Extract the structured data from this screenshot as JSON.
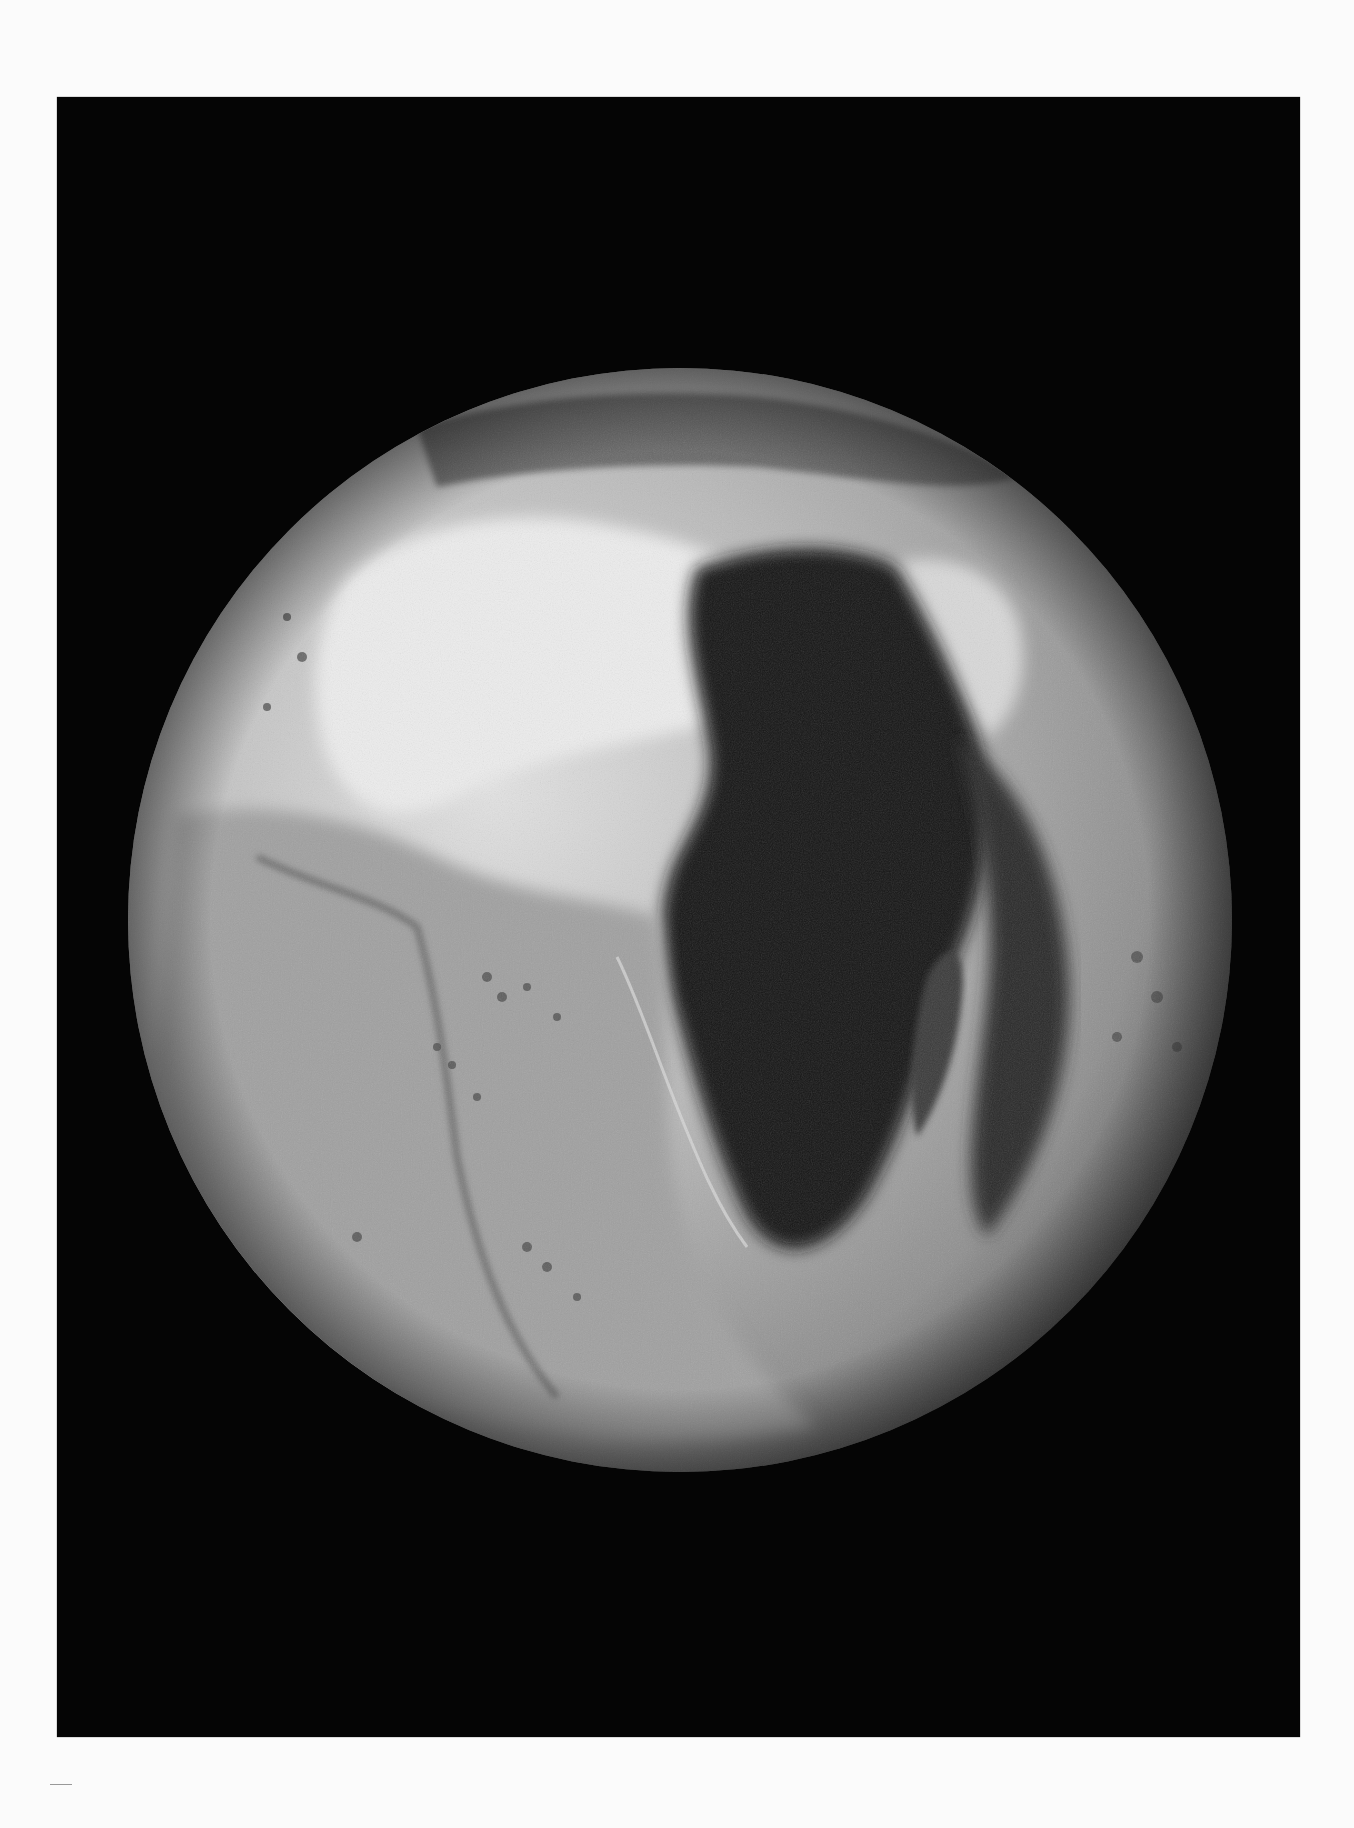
{
  "image": {
    "subject": "relief-globe",
    "description": "Black-and-white photograph of a raised-relief globe showing Africa, the Atlantic Ocean seafloor, the Mid-Atlantic Ridge and the Indian Ocean",
    "colors": {
      "page_background": "#fbfbfb",
      "photo_background": "#050505",
      "globe_highlight": "#e8e8e8",
      "globe_midtone": "#a9a9a9",
      "globe_shadow": "#1c1c1c"
    },
    "visible_features": [
      "Sahara highlands",
      "Atlas mountains",
      "Arabian peninsula",
      "Madagascar",
      "Mid-Atlantic Ridge",
      "Atlantic seamounts",
      "Indian Ocean island chains"
    ]
  }
}
